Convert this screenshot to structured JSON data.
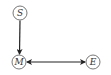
{
  "diagram": {
    "type": "causal-graph",
    "nodes": [
      {
        "id": "S",
        "label": "S",
        "x": 20,
        "y": 13
      },
      {
        "id": "M",
        "label": "M",
        "x": 19,
        "y": 62
      },
      {
        "id": "E",
        "label": "E",
        "x": 93,
        "y": 62
      }
    ],
    "edges": [
      {
        "from": "S",
        "to": "M",
        "direction": "forward"
      },
      {
        "from": "M",
        "to": "E",
        "direction": "bidirectional"
      }
    ]
  }
}
